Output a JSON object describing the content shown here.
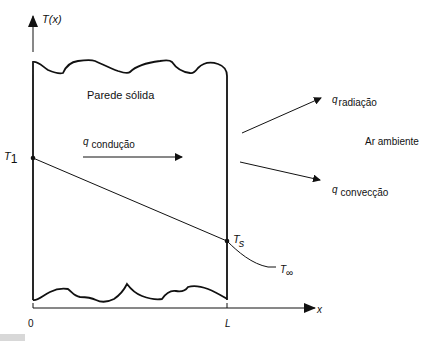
{
  "diagram": {
    "axes": {
      "y_label": "T(x)",
      "x_label": "x",
      "x_ticks": [
        "0",
        "L"
      ]
    },
    "wall": {
      "label": "Parede sólida"
    },
    "points": {
      "t1": {
        "base": "T",
        "sub": "1"
      },
      "ts": {
        "base": "T",
        "sub": "s"
      },
      "tinf": {
        "base": "T",
        "sub": "∞"
      }
    },
    "heat_flows": {
      "conduction": {
        "symbol": "q",
        "sub": "condução"
      },
      "radiation": {
        "symbol": "q",
        "sub": "radiação"
      },
      "convection": {
        "symbol": "q",
        "sub": "convecção"
      }
    },
    "ambient_label": "Ar ambiente",
    "colors": {
      "line": "#111111",
      "background": "#ffffff"
    }
  }
}
